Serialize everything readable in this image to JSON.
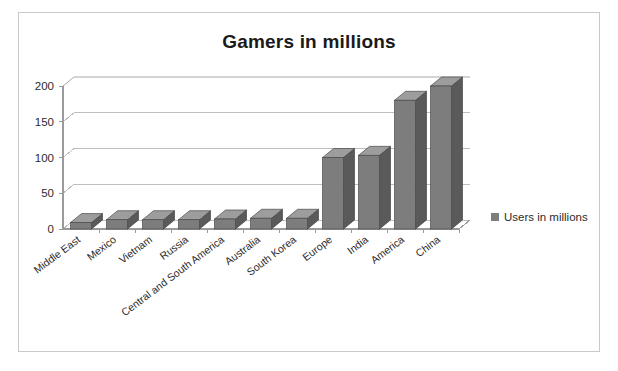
{
  "chart_data": {
    "type": "bar",
    "title": "Gamers in millions",
    "xlabel": "",
    "ylabel": "",
    "ylim": [
      0,
      200
    ],
    "yticks": [
      0,
      50,
      100,
      150,
      200
    ],
    "grid": true,
    "legend_position": "right",
    "categories": [
      "Middle East",
      "Mexico",
      "Vietnam",
      "Russia",
      "Central and South America",
      "Australia",
      "South Korea",
      "Europe",
      "India",
      "America",
      "China"
    ],
    "series": [
      {
        "name": "Users in millions",
        "color": "#7d7d7d",
        "values": [
          9,
          13,
          13,
          13,
          14,
          15,
          15,
          100,
          103,
          180,
          200
        ]
      }
    ]
  },
  "legend": {
    "swatch_color": "#7d7d7d",
    "label": "Users in millions"
  },
  "axis": {
    "y_tick_labels": [
      "200",
      "150",
      "100",
      "50",
      "0"
    ]
  }
}
